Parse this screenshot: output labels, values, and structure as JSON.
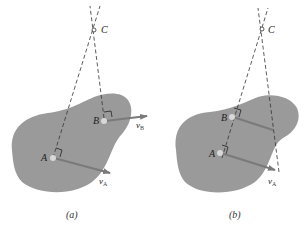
{
  "figure": {
    "colors": {
      "body_fill": "#9a9a9a",
      "vector": "#7a7a7a",
      "dashed_line": "#333333",
      "point_fill": "#d8d8d8",
      "text": "#222222",
      "background": "#ffffff"
    },
    "panels": [
      {
        "id": "a",
        "caption": "(a)",
        "points": {
          "A": "A",
          "B": "B",
          "C": "C"
        },
        "vectors": [
          {
            "symbol": "v",
            "subscript": "A"
          },
          {
            "symbol": "v",
            "subscript": "B"
          }
        ],
        "description": "Instantaneous center C located at intersection of lines perpendicular to vA and vB"
      },
      {
        "id": "b",
        "caption": "(b)",
        "points": {
          "A": "A",
          "B": "B",
          "C": "C"
        },
        "vectors": [
          {
            "symbol": "v",
            "subscript": "A"
          }
        ],
        "description": "Parallel velocities: instantaneous center C found at intersection of line through A and B with line through vector tips"
      }
    ]
  }
}
